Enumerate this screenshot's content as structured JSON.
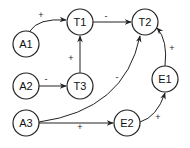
{
  "diagram": {
    "nodes": [
      {
        "id": "A1",
        "label": "A1",
        "cx": 26,
        "cy": 44
      },
      {
        "id": "T1",
        "label": "T1",
        "cx": 80,
        "cy": 22
      },
      {
        "id": "T2",
        "label": "T2",
        "cx": 145,
        "cy": 22
      },
      {
        "id": "A2",
        "label": "A2",
        "cx": 26,
        "cy": 86
      },
      {
        "id": "T3",
        "label": "T3",
        "cx": 80,
        "cy": 86
      },
      {
        "id": "A3",
        "label": "A3",
        "cx": 26,
        "cy": 123
      },
      {
        "id": "E2",
        "label": "E2",
        "cx": 127,
        "cy": 123
      },
      {
        "id": "E1",
        "label": "E1",
        "cx": 165,
        "cy": 79
      }
    ],
    "edges": [
      {
        "from": "A1",
        "to": "T1",
        "sign": "+"
      },
      {
        "from": "T1",
        "to": "T2",
        "sign": "-"
      },
      {
        "from": "T3",
        "to": "T1",
        "sign": "+"
      },
      {
        "from": "A2",
        "to": "T3",
        "sign": "-"
      },
      {
        "from": "A3",
        "to": "T2",
        "sign": "-"
      },
      {
        "from": "A3",
        "to": "E2",
        "sign": "+"
      },
      {
        "from": "E2",
        "to": "E1",
        "sign": "+"
      },
      {
        "from": "E1",
        "to": "T2",
        "sign": "+"
      }
    ]
  }
}
